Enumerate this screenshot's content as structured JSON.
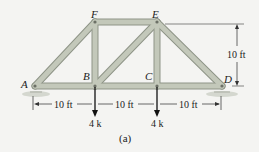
{
  "diagram": {
    "type": "truss",
    "caption": "(a)",
    "colors": {
      "member": "#b9bfb0",
      "member_edge": "#8e9487",
      "text": "#222222",
      "support": "#c8ccc4",
      "background": "#f4f4f2"
    },
    "nodes": {
      "A": {
        "label": "A",
        "x": 35,
        "y": 86
      },
      "B": {
        "label": "B",
        "x": 95,
        "y": 86
      },
      "C": {
        "label": "C",
        "x": 157,
        "y": 86
      },
      "D": {
        "label": "D",
        "x": 222,
        "y": 86
      },
      "E": {
        "label": "E",
        "x": 157,
        "y": 22
      },
      "F": {
        "label": "F",
        "x": 95,
        "y": 22
      }
    },
    "members": [
      [
        "A",
        "F"
      ],
      [
        "F",
        "E"
      ],
      [
        "E",
        "D"
      ],
      [
        "A",
        "B"
      ],
      [
        "B",
        "C"
      ],
      [
        "C",
        "D"
      ],
      [
        "F",
        "B"
      ],
      [
        "E",
        "C"
      ],
      [
        "B",
        "E"
      ]
    ],
    "loads": [
      {
        "node": "B",
        "label": "4 k"
      },
      {
        "node": "C",
        "label": "4 k"
      }
    ],
    "dimensions": {
      "spans": [
        "10 ft",
        "10 ft",
        "10 ft"
      ],
      "height": "10 ft"
    }
  }
}
